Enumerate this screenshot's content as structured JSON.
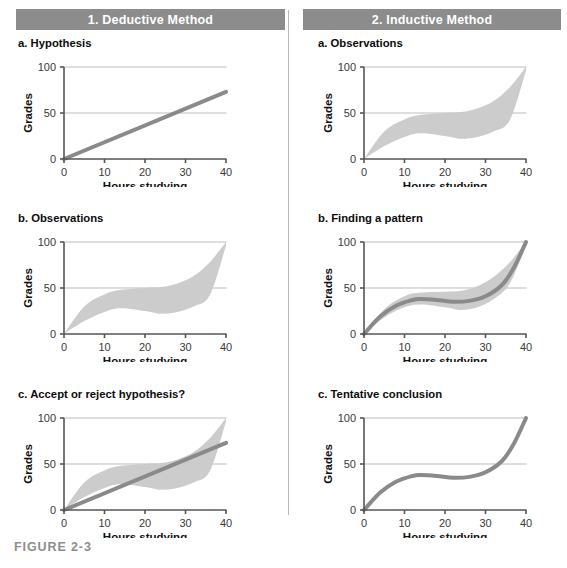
{
  "figure": {
    "caption": "FIGURE 2-3",
    "axis": {
      "x_label": "Hours studying",
      "y_label": "Grades",
      "x_ticks": [
        "0",
        "10",
        "20",
        "30",
        "40"
      ],
      "y_ticks": [
        "0",
        "50",
        "100"
      ],
      "xlim": [
        0,
        40
      ],
      "ylim": [
        0,
        100
      ]
    },
    "colors": {
      "header_bar": "#8c8c8c",
      "header_text": "#ffffff",
      "band_fill": "#c9c9c9",
      "curve": "#8a8a8a",
      "axis": "#555555",
      "gridline": "#bdbdbd",
      "divider": "#b9b9b9",
      "caption": "#8d8d8d"
    }
  },
  "columns": [
    {
      "header": "1. Deductive Method",
      "panels": [
        {
          "label": "a. Hypothesis"
        },
        {
          "label": "b. Observations"
        },
        {
          "label": "c. Accept or reject hypothesis?"
        }
      ]
    },
    {
      "header": "2. Inductive Method",
      "panels": [
        {
          "label": "a. Observations"
        },
        {
          "label": "b. Finding a pattern"
        },
        {
          "label": "c. Tentative conclusion"
        }
      ]
    }
  ],
  "chart_data": [
    {
      "id": "deductive-a-hypothesis",
      "type": "line",
      "title": "a. Hypothesis",
      "xlabel": "Hours studying",
      "ylabel": "Grades",
      "xlim": [
        0,
        40
      ],
      "ylim": [
        0,
        100
      ],
      "xticks": [
        0,
        10,
        20,
        30,
        40
      ],
      "yticks": [
        0,
        50,
        100
      ],
      "grid": "horizontal",
      "series": [
        {
          "name": "hypothesized linear relationship",
          "kind": "line",
          "x": [
            0,
            5,
            10,
            15,
            20,
            25,
            30,
            35,
            40
          ],
          "y": [
            0,
            9,
            18,
            27,
            36,
            46,
            55,
            64,
            73
          ]
        }
      ]
    },
    {
      "id": "deductive-b-observations",
      "type": "area",
      "title": "b. Observations",
      "xlabel": "Hours studying",
      "ylabel": "Grades",
      "xlim": [
        0,
        40
      ],
      "ylim": [
        0,
        100
      ],
      "xticks": [
        0,
        10,
        20,
        30,
        40
      ],
      "yticks": [
        0,
        50,
        100
      ],
      "grid": "horizontal",
      "series": [
        {
          "name": "observation scatter band",
          "kind": "band",
          "x": [
            0,
            5,
            10,
            14,
            20,
            24,
            28,
            32,
            36,
            40
          ],
          "y_upper": [
            0,
            30,
            43,
            48,
            50,
            51,
            55,
            63,
            78,
            100
          ],
          "y_lower": [
            0,
            14,
            24,
            28,
            25,
            22,
            24,
            30,
            42,
            96
          ]
        }
      ]
    },
    {
      "id": "deductive-c-accept-reject",
      "type": "area",
      "title": "c. Accept or reject hypothesis?",
      "xlabel": "Hours studying",
      "ylabel": "Grades",
      "xlim": [
        0,
        40
      ],
      "ylim": [
        0,
        100
      ],
      "xticks": [
        0,
        10,
        20,
        30,
        40
      ],
      "yticks": [
        0,
        50,
        100
      ],
      "grid": "horizontal",
      "series": [
        {
          "name": "observation scatter band",
          "kind": "band",
          "x": [
            0,
            5,
            10,
            14,
            20,
            24,
            28,
            32,
            36,
            40
          ],
          "y_upper": [
            0,
            30,
            43,
            48,
            50,
            51,
            55,
            63,
            78,
            100
          ],
          "y_lower": [
            0,
            14,
            24,
            28,
            25,
            22,
            24,
            30,
            42,
            96
          ]
        },
        {
          "name": "hypothesized linear relationship",
          "kind": "line",
          "x": [
            0,
            5,
            10,
            15,
            20,
            25,
            30,
            35,
            40
          ],
          "y": [
            0,
            9,
            18,
            27,
            36,
            46,
            55,
            64,
            73
          ]
        }
      ]
    },
    {
      "id": "inductive-a-observations",
      "type": "area",
      "title": "a. Observations",
      "xlabel": "Hours studying",
      "ylabel": "Grades",
      "xlim": [
        0,
        40
      ],
      "ylim": [
        0,
        100
      ],
      "xticks": [
        0,
        10,
        20,
        30,
        40
      ],
      "yticks": [
        0,
        50,
        100
      ],
      "grid": "horizontal",
      "series": [
        {
          "name": "observation scatter band",
          "kind": "band",
          "x": [
            0,
            5,
            10,
            14,
            20,
            24,
            28,
            32,
            36,
            40
          ],
          "y_upper": [
            0,
            30,
            43,
            48,
            50,
            51,
            55,
            63,
            78,
            100
          ],
          "y_lower": [
            0,
            14,
            24,
            28,
            25,
            22,
            24,
            30,
            42,
            96
          ]
        }
      ]
    },
    {
      "id": "inductive-b-finding-pattern",
      "type": "area",
      "title": "b. Finding a pattern",
      "xlabel": "Hours studying",
      "ylabel": "Grades",
      "xlim": [
        0,
        40
      ],
      "ylim": [
        0,
        100
      ],
      "xticks": [
        0,
        10,
        20,
        30,
        40
      ],
      "yticks": [
        0,
        50,
        100
      ],
      "grid": "horizontal",
      "series": [
        {
          "name": "observation scatter band",
          "kind": "band",
          "x": [
            0,
            5,
            10,
            14,
            20,
            24,
            28,
            32,
            36,
            40
          ],
          "y_upper": [
            0,
            27,
            41,
            45,
            46,
            47,
            52,
            62,
            78,
            100
          ],
          "y_lower": [
            0,
            18,
            29,
            32,
            29,
            26,
            29,
            38,
            55,
            96
          ]
        },
        {
          "name": "fitted pattern curve",
          "kind": "line",
          "x": [
            0,
            4,
            8,
            12,
            14,
            18,
            22,
            26,
            30,
            34,
            37,
            40
          ],
          "y": [
            0,
            19,
            31,
            37,
            38,
            37,
            35,
            36,
            41,
            53,
            72,
            100
          ]
        }
      ]
    },
    {
      "id": "inductive-c-tentative-conclusion",
      "type": "line",
      "title": "c. Tentative conclusion",
      "xlabel": "Hours studying",
      "ylabel": "Grades",
      "xlim": [
        0,
        40
      ],
      "ylim": [
        0,
        100
      ],
      "xticks": [
        0,
        10,
        20,
        30,
        40
      ],
      "yticks": [
        0,
        50,
        100
      ],
      "grid": "horizontal",
      "series": [
        {
          "name": "tentative conclusion curve",
          "kind": "line",
          "x": [
            0,
            4,
            8,
            12,
            14,
            18,
            22,
            26,
            30,
            34,
            37,
            40
          ],
          "y": [
            0,
            19,
            31,
            37,
            38,
            37,
            35,
            36,
            41,
            53,
            72,
            100
          ]
        }
      ]
    }
  ]
}
